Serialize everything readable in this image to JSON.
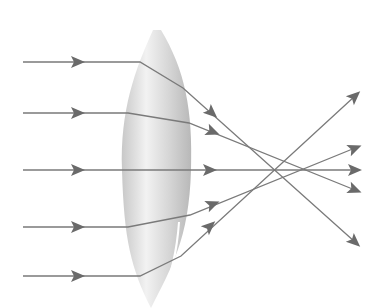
{
  "diagram": {
    "colors": {
      "background": "#ffffff",
      "ray": "#7a7a7a",
      "arrow": "#6a6a6a",
      "lens_light": "#efefef",
      "lens_mid": "#d2d2d2",
      "lens_dark": "#b4b4b4",
      "highlight": "#ffffff"
    },
    "lens": {
      "top": [
        157,
        30
      ],
      "bottom": [
        151,
        308
      ],
      "left_x": 122,
      "right_x": 191
    },
    "rays": [
      {
        "id": "ray-1",
        "points": [
          [
            23,
            62
          ],
          [
            140,
            62
          ],
          [
            183,
            88
          ],
          [
            355,
            242
          ]
        ],
        "in_arrow": [
          78,
          62
        ],
        "out_arrow": [
          212,
          113
        ]
      },
      {
        "id": "ray-2",
        "points": [
          [
            23,
            113
          ],
          [
            128,
            113
          ],
          [
            189,
            123
          ],
          [
            355,
            190
          ]
        ],
        "in_arrow": [
          78,
          113
        ],
        "out_arrow": [
          213,
          132
        ]
      },
      {
        "id": "ray-3",
        "points": [
          [
            23,
            170
          ],
          [
            122,
            170
          ],
          [
            191,
            170
          ],
          [
            355,
            170
          ]
        ],
        "in_arrow": [
          78,
          170
        ],
        "out_arrow": [
          210,
          170
        ]
      },
      {
        "id": "ray-4",
        "points": [
          [
            23,
            227
          ],
          [
            128,
            227
          ],
          [
            190,
            215
          ],
          [
            355,
            148
          ]
        ],
        "in_arrow": [
          78,
          227
        ],
        "out_arrow": [
          213,
          204
        ]
      },
      {
        "id": "ray-5",
        "points": [
          [
            23,
            276
          ],
          [
            140,
            276
          ],
          [
            181,
            256
          ],
          [
            355,
            96
          ]
        ],
        "in_arrow": [
          78,
          276
        ],
        "out_arrow": [
          210,
          226
        ]
      }
    ]
  }
}
